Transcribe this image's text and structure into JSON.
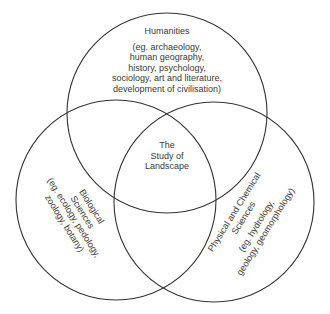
{
  "diagram": {
    "type": "venn",
    "stroke_color": "#333333",
    "circles": [
      {
        "id": "humanities",
        "title": "Humanities",
        "detail_lines": [
          "(eg. archaeology,",
          "human geography,",
          "history, psychology,",
          "sociology, art and literature,",
          "development of civilisation)"
        ]
      },
      {
        "id": "biological",
        "title_lines": [
          "Biological",
          "Sciences"
        ],
        "detail_lines": [
          "(eg. ecology, pedology,",
          "zoology, botany)"
        ]
      },
      {
        "id": "physical",
        "title_lines": [
          "Physical and Chemical",
          "Sciences"
        ],
        "detail_lines": [
          "(eg. hydrology,",
          "geology, geomorphology)"
        ]
      }
    ],
    "center": {
      "lines": [
        "The",
        "Study of",
        "Landscape"
      ]
    }
  }
}
